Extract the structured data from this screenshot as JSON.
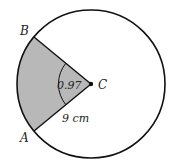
{
  "diagram": {
    "type": "circle-sector",
    "points": {
      "A": {
        "label": "A"
      },
      "B": {
        "label": "B"
      },
      "C": {
        "label": "C"
      }
    },
    "angle_label": "0.97",
    "radius_label": "9 cm",
    "colors": {
      "stroke": "#111111",
      "sector_fill": "#b8b8b8",
      "background": "#ffffff"
    }
  }
}
